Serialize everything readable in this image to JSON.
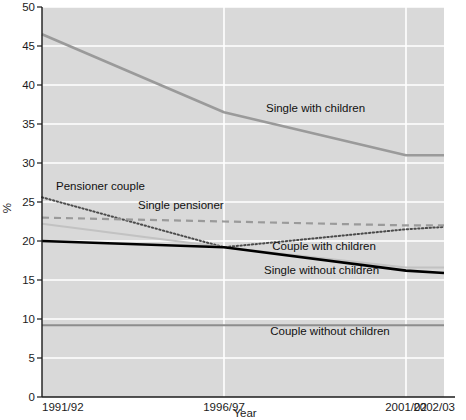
{
  "chart_data": {
    "type": "line",
    "title": "",
    "xlabel": "Year",
    "ylabel": "%",
    "x": [
      "1991/92",
      "1996/97",
      "2001/02",
      "2002/03"
    ],
    "xtick_labels": [
      "1991/92",
      "1996/97",
      "2001/02",
      "2002/03"
    ],
    "ytick_labels": [
      "0",
      "5",
      "10",
      "15",
      "20",
      "25",
      "30",
      "35",
      "40",
      "45",
      "50"
    ],
    "ylim": [
      0,
      50
    ],
    "ytick_step": 5,
    "grid": "horizontal-and-vertical",
    "legend_position": "inline-labels",
    "plot_background": "#d9d9d9",
    "gridline_color": "#ffffff",
    "series": [
      {
        "name": "Single with children",
        "label": "Single with children",
        "style": "solid",
        "color": "#9a9a9a",
        "width": 2.6,
        "values": [
          46.5,
          36.5,
          31.0,
          31.0
        ]
      },
      {
        "name": "Pensioner couple",
        "label": "Pensioner couple",
        "style": "dotted",
        "color": "#4a4a4a",
        "width": 2.0,
        "values": [
          25.6,
          19.2,
          21.5,
          21.8
        ]
      },
      {
        "name": "Single pensioner",
        "label": "Single pensioner",
        "style": "dashed",
        "color": "#9a9a9a",
        "width": 2.2,
        "values": [
          23.0,
          22.5,
          22.0,
          22.0
        ]
      },
      {
        "name": "Couple with children",
        "label": "Couple with children",
        "style": "solid",
        "color": "#c2c2c2",
        "width": 2.0,
        "values": [
          22.2,
          19.2,
          16.6,
          16.6
        ]
      },
      {
        "name": "Single without children",
        "label": "Single without children",
        "style": "solid",
        "color": "#000000",
        "width": 2.6,
        "values": [
          20.0,
          19.2,
          16.2,
          15.9
        ]
      },
      {
        "name": "Couple without children",
        "label": "Couple without children",
        "style": "solid",
        "color": "#8d8d8d",
        "width": 1.8,
        "values": [
          9.2,
          9.2,
          9.2,
          9.2
        ]
      }
    ],
    "annotations": [
      {
        "text": "Single with children",
        "x": 266,
        "y": 112
      },
      {
        "text": "Pensioner couple",
        "x": 56,
        "y": 190
      },
      {
        "text": "Single pensioner",
        "x": 138,
        "y": 209
      },
      {
        "text": "Couple with children",
        "x": 324,
        "y": 250
      },
      {
        "text": "Single without children",
        "x": 264,
        "y": 274
      },
      {
        "text": "Couple without children",
        "x": 330,
        "y": 335
      }
    ]
  }
}
